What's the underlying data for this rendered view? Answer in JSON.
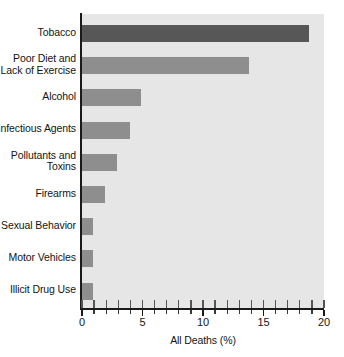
{
  "chart_data": {
    "type": "bar",
    "orientation": "horizontal",
    "title": "",
    "xlabel": "All Deaths (%)",
    "ylabel": "",
    "xlim": [
      0,
      20
    ],
    "xticks": [
      0,
      5,
      10,
      15,
      20
    ],
    "xtick_labels": [
      "0",
      "5",
      "10",
      "15",
      "20"
    ],
    "minor_tick_interval": 1,
    "grid": false,
    "legend": null,
    "categories": [
      "Tobacco",
      "Poor Diet and Lack of Exercise",
      "Alcohol",
      "Infectious Agents",
      "Pollutants and Toxins",
      "Firearms",
      "Sexual Behavior",
      "Motor Vehicles",
      "Illicit Drug Use"
    ],
    "category_lines": [
      [
        "Tobacco"
      ],
      [
        "Poor Diet and",
        "Lack of Exercise"
      ],
      [
        "Alcohol"
      ],
      [
        "Infectious Agents"
      ],
      [
        "Pollutants and",
        "Toxins"
      ],
      [
        "Firearms"
      ],
      [
        "Sexual Behavior"
      ],
      [
        "Motor Vehicles"
      ],
      [
        "Illicit Drug Use"
      ]
    ],
    "values": [
      18.8,
      13.8,
      4.9,
      4.0,
      2.9,
      1.9,
      0.9,
      0.9,
      0.9
    ],
    "highlight_index": 0,
    "colors": {
      "bar": "#8e8e8e",
      "bar_highlight": "#575757",
      "plot_background": "#e6e6e6",
      "axis": "#1a1a1a",
      "text": "#141414",
      "figure_background": "#ffffff"
    }
  }
}
